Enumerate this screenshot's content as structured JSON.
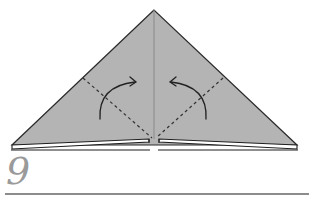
{
  "diagram": {
    "step_number": "9",
    "colors": {
      "paper": "#b4b4b4",
      "outline": "#2a2a2a",
      "crease": "#8a8a8a",
      "fold_line": "#333333",
      "arrow": "#222222",
      "step_number": "#9a9a9a",
      "rule": "#8c8c8c"
    },
    "shape": "triangle",
    "fold_lines": [
      {
        "type": "valley-fold",
        "from": [
          83,
          78
        ],
        "to": [
          152,
          138
        ]
      },
      {
        "type": "valley-fold",
        "from": [
          223,
          78
        ],
        "to": [
          156,
          138
        ]
      }
    ],
    "arrows": [
      {
        "direction": "fold-left-corner-up-to-center"
      },
      {
        "direction": "fold-right-corner-up-to-center"
      }
    ]
  }
}
